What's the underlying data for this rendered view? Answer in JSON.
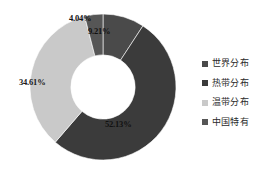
{
  "chart_data": {
    "type": "pie",
    "variant": "doughnut",
    "title": "",
    "subtitle": "",
    "xlabel": "",
    "ylabel": "",
    "grid": false,
    "legend_position": "right",
    "hole_ratio": 0.44,
    "start_angle_deg": 0,
    "direction": "clockwise",
    "categories": [
      "世界分布",
      "热带分布",
      "温带分布",
      "中国特有"
    ],
    "values": [
      9.21,
      52.13,
      34.61,
      4.04
    ],
    "value_unit": "%",
    "data_labels": [
      "9.21%",
      "52.13%",
      "34.61%",
      "4.04%"
    ],
    "colors": [
      "#4a4a4a",
      "#3b3b3b",
      "#c9c9c9",
      "#565656"
    ],
    "slices": [
      {
        "label": "世界分布",
        "value": 9.21,
        "data_label": "9.21%",
        "color": "#4a4a4a"
      },
      {
        "label": "热带分布",
        "value": 52.13,
        "data_label": "52.13%",
        "color": "#3b3b3b"
      },
      {
        "label": "温带分布",
        "value": 34.61,
        "data_label": "34.61%",
        "color": "#c9c9c9"
      },
      {
        "label": "中国特有",
        "value": 4.04,
        "data_label": "4.04%",
        "color": "#565656"
      }
    ]
  },
  "legend": {
    "items": [
      {
        "label": "世界分布",
        "color": "#4a4a4a"
      },
      {
        "label": "热带分布",
        "color": "#3b3b3b"
      },
      {
        "label": "温带分布",
        "color": "#c9c9c9"
      },
      {
        "label": "中国特有",
        "color": "#565656"
      }
    ]
  },
  "labels": {
    "world": "9.21%",
    "tropical": "52.13%",
    "temperate": "34.61%",
    "china": "4.04%"
  }
}
